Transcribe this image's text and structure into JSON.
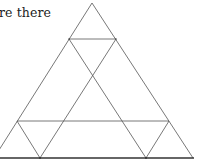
{
  "question": {
    "text": "re there"
  },
  "diagram": {
    "type": "triangle-count-figure",
    "stroke_color": "#555555",
    "base_color": "#333333",
    "outer_triangle": {
      "apex": [
        92,
        3
      ],
      "left_base": [
        -6,
        158
      ],
      "right_base": [
        193,
        158
      ]
    },
    "segments": [
      {
        "name": "upper-horizontal",
        "from": [
          69,
          39
        ],
        "to": [
          116,
          39
        ]
      },
      {
        "name": "lower-horizontal",
        "from": [
          17,
          121
        ],
        "to": [
          169,
          121
        ]
      },
      {
        "name": "inner-diagonal-left-to-right",
        "from": [
          69,
          39
        ],
        "to": [
          146,
          158
        ]
      },
      {
        "name": "inner-diagonal-right-to-left",
        "from": [
          116,
          39
        ],
        "to": [
          40,
          158
        ]
      },
      {
        "name": "bottom-left-diagonal",
        "from": [
          17,
          121
        ],
        "to": [
          40,
          158
        ]
      },
      {
        "name": "bottom-right-diagonal",
        "from": [
          169,
          121
        ],
        "to": [
          146,
          158
        ]
      }
    ]
  }
}
